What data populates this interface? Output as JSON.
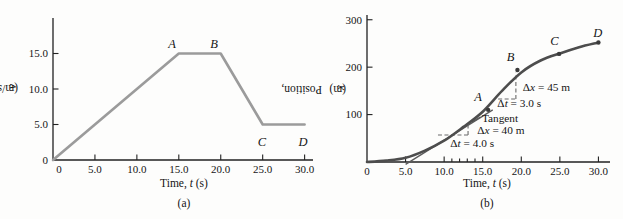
{
  "figure": {
    "panels": [
      {
        "caption": "(a)",
        "xlabel": "Time, *t* (s)",
        "ylabel": "Velocity, *v* (m/s)"
      },
      {
        "caption": "(b)",
        "xlabel": "Time, *t* (s)",
        "ylabel": "Position, *x* (m)"
      }
    ]
  },
  "colors": {
    "curve_a": "#9b9b9b",
    "curve_b": "#4d4d4d",
    "axis": "#222222",
    "text": "#151515",
    "dashed": "#6b6b6b",
    "tangent": "#5a5a5a",
    "dot": "#3a3a3a"
  },
  "chart_data": [
    {
      "type": "line",
      "caption": "(a)",
      "xlabel": "Time, t (s)",
      "ylabel": "Velocity, v (m/s)",
      "xlim": [
        0,
        31
      ],
      "ylim": [
        0,
        20
      ],
      "grid": false,
      "legend": "none",
      "xticks": [
        {
          "v": 0,
          "label": "0",
          "tick": false,
          "dx": 6
        },
        {
          "v": 5,
          "label": "5.0"
        },
        {
          "v": 10,
          "label": "10.0"
        },
        {
          "v": 15,
          "label": "15.0"
        },
        {
          "v": 20,
          "label": "20.0"
        },
        {
          "v": 25,
          "label": "25.0"
        },
        {
          "v": 30,
          "label": "30.0"
        }
      ],
      "yticks": [
        {
          "v": 0,
          "label": "0",
          "tick": false
        },
        {
          "v": 5,
          "label": "5.0"
        },
        {
          "v": 10,
          "label": "10.0"
        },
        {
          "v": 15,
          "label": "15.0"
        }
      ],
      "series": [
        {
          "name": "velocity",
          "color_key": "curve_a",
          "smooth": false,
          "points": [
            [
              0,
              0
            ],
            [
              15,
              15
            ],
            [
              20,
              15
            ],
            [
              25,
              5
            ],
            [
              30,
              5
            ]
          ]
        }
      ],
      "dots": [],
      "point_labels": [
        {
          "text": "A",
          "x": 14.2,
          "y": 16.3
        },
        {
          "text": "B",
          "x": 19.2,
          "y": 16.3
        },
        {
          "text": "C",
          "x": 24.9,
          "y": 2.6
        },
        {
          "text": "D",
          "x": 29.8,
          "y": 2.6
        }
      ]
    },
    {
      "type": "line",
      "caption": "(b)",
      "xlabel": "Time, t (s)",
      "ylabel": "Position, x (m)",
      "xlim": [
        0,
        31.5
      ],
      "ylim": [
        0,
        310
      ],
      "grid": false,
      "legend": "none",
      "xticks": [
        {
          "v": 0,
          "label": "0",
          "tick": false
        },
        {
          "v": 5,
          "label": "5.0"
        },
        {
          "v": 10,
          "label": "10.0"
        },
        {
          "v": 11,
          "minor": true
        },
        {
          "v": 12,
          "minor": true
        },
        {
          "v": 13,
          "minor": true
        },
        {
          "v": 14,
          "minor": true
        },
        {
          "v": 15,
          "label": "15.0"
        },
        {
          "v": 20,
          "label": "20.0"
        },
        {
          "v": 25,
          "label": "25.0"
        },
        {
          "v": 30,
          "label": "30.0"
        }
      ],
      "yticks": [
        {
          "v": 100,
          "label": "100"
        },
        {
          "v": 200,
          "label": "200"
        },
        {
          "v": 300,
          "label": "300"
        }
      ],
      "series": [
        {
          "name": "position",
          "color_key": "curve_b",
          "smooth": true,
          "points": [
            [
              0,
              0
            ],
            [
              2.5,
              3
            ],
            [
              5,
              9
            ],
            [
              7.5,
              24
            ],
            [
              10,
              45
            ],
            [
              12.5,
              74
            ],
            [
              15,
              106
            ],
            [
              17.5,
              150
            ],
            [
              20,
              189
            ],
            [
              22.5,
              214
            ],
            [
              25,
              229
            ],
            [
              27.5,
              242
            ],
            [
              30,
              252
            ]
          ]
        }
      ],
      "dots": [
        [
          15.7,
          110
        ],
        [
          19.5,
          194
        ],
        [
          24.9,
          228
        ],
        [
          30,
          252
        ]
      ],
      "point_labels": [
        {
          "text": "A",
          "x": 14.4,
          "y": 137
        },
        {
          "text": "B",
          "x": 18.6,
          "y": 221
        },
        {
          "text": "C",
          "x": 24.3,
          "y": 255
        },
        {
          "text": "D",
          "x": 29.9,
          "y": 273
        }
      ],
      "annotations": {
        "lines": [
          {
            "name": "tangent-line",
            "x1": 5.0,
            "y1": -5,
            "x2": 16.3,
            "y2": 110,
            "dashed": false,
            "color_key": "tangent"
          },
          {
            "name": "tangent-leader-line",
            "x1": 13.6,
            "y1": 84,
            "x2": 14.7,
            "y2": 95,
            "dashed": false,
            "color_key": "tangent"
          },
          {
            "name": "delta-t-40-dash",
            "x1": 9.2,
            "y1": 57,
            "x2": 13.1,
            "y2": 57,
            "dashed": true,
            "color_key": "dashed"
          },
          {
            "name": "delta-x-40-dash",
            "x1": 13.1,
            "y1": 57,
            "x2": 13.1,
            "y2": 77,
            "dashed": true,
            "color_key": "dashed"
          },
          {
            "name": "delta-x-45-dash",
            "x1": 19.3,
            "y1": 133,
            "x2": 19.3,
            "y2": 188,
            "dashed": true,
            "color_key": "dashed"
          },
          {
            "name": "delta-t-45-dash",
            "x1": 17.0,
            "y1": 133,
            "x2": 19.5,
            "y2": 133,
            "dashed": true,
            "color_key": "dashed"
          }
        ],
        "texts": [
          {
            "name": "tangent-label",
            "text": "Tangent",
            "x": 14.9,
            "y": 93,
            "anchor": "start"
          },
          {
            "name": "delta-x-40-label",
            "text": "Δ*x* = 40 m",
            "x": 14.3,
            "y": 67,
            "anchor": "start"
          },
          {
            "name": "delta-t-40-label",
            "text": "Δ*t* = 4.0 s",
            "x": 10.8,
            "y": 40,
            "anchor": "start"
          },
          {
            "name": "delta-x-45-label",
            "text": "Δ*x* = 45 m",
            "x": 20.2,
            "y": 158,
            "anchor": "start"
          },
          {
            "name": "delta-t-45-label",
            "text": "Δ*t* = 3.0 s",
            "x": 16.9,
            "y": 124,
            "anchor": "start"
          }
        ]
      }
    }
  ]
}
